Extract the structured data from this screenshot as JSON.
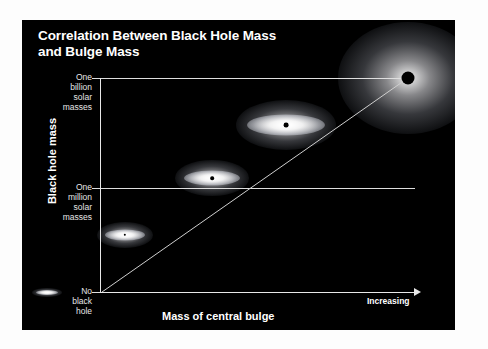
{
  "title": {
    "line1": "Correlation Between Black Hole Mass",
    "line2": "and Bulge Mass"
  },
  "axes": {
    "y_title": "Black hole mass",
    "x_title": "Mass of central bulge",
    "x_direction_label": "Increasing",
    "y_ticks": [
      {
        "label": "One\nbillion\nsolar\nmasses"
      },
      {
        "label": "One\nmillion\nsolar\nmasses"
      },
      {
        "label": "No\nblack\nhole"
      }
    ]
  },
  "colors": {
    "background": "#ffffff",
    "panel": "#000000",
    "axis": "#e8e8e8",
    "grid": "#dedede",
    "text": "#ffffff",
    "tick_text": "#e6e6e6",
    "galaxy": "#ffffff",
    "black_hole": "#000000"
  },
  "chart_data": {
    "type": "scatter",
    "title": "Correlation Between Black Hole Mass and Bulge Mass",
    "xlabel": "Mass of central bulge",
    "ylabel": "Black hole mass",
    "grid": true,
    "legend": false,
    "x_tick_labels": [
      "Increasing"
    ],
    "y_tick_labels": [
      "No black hole",
      "One million solar masses",
      "One billion solar masses"
    ],
    "annotations": [
      "Increasing"
    ],
    "series": [
      {
        "name": "Galaxies",
        "points": [
          {
            "x": 0.0,
            "y": 0.0,
            "bulge_size": 1,
            "black_hole_size": 0,
            "y_label": "No black hole"
          },
          {
            "x": 0.22,
            "y": 0.24,
            "bulge_size": 2,
            "black_hole_size": 1
          },
          {
            "x": 0.48,
            "y": 0.51,
            "bulge_size": 3,
            "black_hole_size": 2,
            "y_label": "One million solar masses"
          },
          {
            "x": 0.7,
            "y": 0.72,
            "bulge_size": 4,
            "black_hole_size": 3
          },
          {
            "x": 1.0,
            "y": 1.0,
            "bulge_size": 5,
            "black_hole_size": 5,
            "y_label": "One billion solar masses"
          }
        ]
      }
    ],
    "trendline": {
      "from": [
        0.0,
        0.0
      ],
      "to": [
        1.0,
        1.0
      ],
      "description": "linear correlation"
    }
  },
  "galaxies": [
    {
      "name": "galaxy-1",
      "cx": 25,
      "cy": 272,
      "halo_w": 30,
      "halo_h": 9,
      "disk_w": 22,
      "disk_h": 5,
      "bh": 0
    },
    {
      "name": "galaxy-2",
      "cx": 103,
      "cy": 215,
      "halo_w": 56,
      "halo_h": 26,
      "disk_w": 40,
      "disk_h": 11,
      "bh": 2.4
    },
    {
      "name": "galaxy-3",
      "cx": 190,
      "cy": 158,
      "halo_w": 74,
      "halo_h": 36,
      "disk_w": 56,
      "disk_h": 15,
      "bh": 3.6
    },
    {
      "name": "galaxy-4",
      "cx": 264,
      "cy": 105,
      "halo_w": 100,
      "halo_h": 50,
      "disk_w": 78,
      "disk_h": 21,
      "bh": 4.8
    },
    {
      "name": "galaxy-5",
      "cx": 386,
      "cy": 58,
      "halo_w": 140,
      "halo_h": 112,
      "disk_w": 0,
      "disk_h": 0,
      "bh": 13
    }
  ]
}
